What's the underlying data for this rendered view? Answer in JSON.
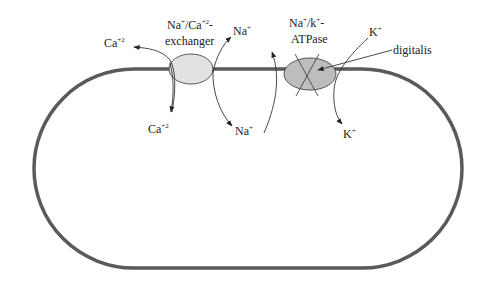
{
  "diagram": {
    "type": "cell-membrane-ion-transport",
    "colors": {
      "membrane": "#5a5a5a",
      "exchanger_fill": "#e2e2e2",
      "pump_fill": "#bdbdbd",
      "arrow": "#333333",
      "text": "#222222"
    },
    "exchanger": {
      "label_line1_base": "Na",
      "label_line1_sup1": "+",
      "label_line1_mid": "/Ca",
      "label_line1_sup2": "+2",
      "label_line1_end": "-",
      "label_line2": "exchanger"
    },
    "pump": {
      "label_line1_base": "Na",
      "label_line1_sup1": "+",
      "label_line1_mid": "/k",
      "label_line1_sup2": "+",
      "label_line1_end": "-",
      "label_line2": "ATPase"
    },
    "inhibitor": {
      "label": "digitalis"
    },
    "ions": {
      "ca_out": {
        "base": "Ca",
        "sup": "+2"
      },
      "ca_in": {
        "base": "Ca",
        "sup": "+2"
      },
      "na_out": {
        "base": "Na",
        "sup": "+"
      },
      "na_in": {
        "base": "Na",
        "sup": "+"
      },
      "k_out": {
        "base": "K",
        "sup": "+"
      },
      "k_in": {
        "base": "K",
        "sup": "+"
      }
    }
  }
}
